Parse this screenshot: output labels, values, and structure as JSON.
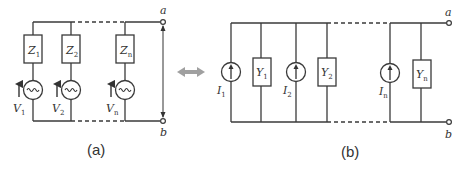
{
  "figure": {
    "caption_a": "(a)",
    "caption_b": "(b)",
    "equivalence_arrow_color": "#a0a0a0"
  },
  "circuit_a": {
    "type": "series voltage sources with impedances in parallel",
    "terminal_top": "a",
    "terminal_bottom": "b",
    "branches": [
      {
        "impedance": "Z",
        "impedance_sub": "1",
        "source": "V",
        "source_sub": "1"
      },
      {
        "impedance": "Z",
        "impedance_sub": "2",
        "source": "V",
        "source_sub": "2"
      },
      {
        "impedance": "Z",
        "impedance_sub": "n",
        "source": "V",
        "source_sub": "n"
      }
    ]
  },
  "circuit_b": {
    "type": "current sources with admittances in parallel",
    "terminal_top": "a",
    "terminal_bottom": "b",
    "branches": [
      {
        "source": "I",
        "source_sub": "1",
        "admittance": "Y",
        "admittance_sub": "1"
      },
      {
        "source": "I",
        "source_sub": "2",
        "admittance": "Y",
        "admittance_sub": "2"
      },
      {
        "source": "I",
        "source_sub": "n",
        "admittance": "Y",
        "admittance_sub": "n"
      }
    ]
  }
}
